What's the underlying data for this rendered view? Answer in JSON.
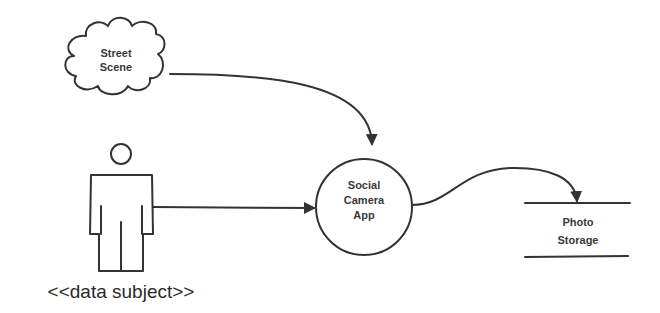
{
  "diagram": {
    "type": "data-flow-diagram",
    "nodes": {
      "street_scene": {
        "shape": "cloud",
        "line1": "Street",
        "line2": "Scene"
      },
      "data_subject": {
        "shape": "stick-person",
        "label": "<<data subject>>"
      },
      "social_camera_app": {
        "shape": "circle",
        "line1": "Social",
        "line2": "Camera",
        "line3": "App"
      },
      "photo_storage": {
        "shape": "data-store",
        "line1": "Photo",
        "line2": "Storage"
      }
    },
    "edges": [
      {
        "from": "Street Scene",
        "to": "Social Camera App"
      },
      {
        "from": "data subject",
        "to": "Social Camera App"
      },
      {
        "from": "Social Camera App",
        "to": "Photo Storage"
      }
    ],
    "colors": {
      "stroke": "#333333",
      "text": "#3a3a3a",
      "background": "#ffffff"
    }
  }
}
